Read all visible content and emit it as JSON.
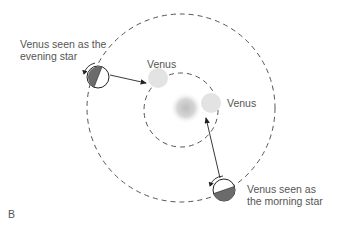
{
  "diagram": {
    "panel_letter": "B",
    "labels": {
      "evening_line1": "Venus seen as the",
      "evening_line2": "evening star",
      "morning_line1": "Venus seen as",
      "morning_line2": "the morning star",
      "venus_top": "Venus",
      "venus_right": "Venus"
    },
    "colors": {
      "orbit": "#555555",
      "venus_fill": "#e3e3e3",
      "sun_center": "#bdbdbd",
      "earth_shade": "#6b6b6b",
      "earth_outline": "#222222",
      "arrow": "#222222",
      "text": "#555555"
    },
    "geometry": {
      "outer_orbit": {
        "cx": 181,
        "cy": 108,
        "r": 94
      },
      "inner_orbit": {
        "cx": 181,
        "cy": 110,
        "r": 37
      },
      "sun": {
        "cx": 186,
        "cy": 108,
        "r": 15
      },
      "venus_top": {
        "cx": 158,
        "cy": 78,
        "r": 10
      },
      "venus_right": {
        "cx": 211,
        "cy": 103,
        "r": 10
      },
      "earth_evening": {
        "cx": 98,
        "cy": 77,
        "r": 11
      },
      "earth_morning": {
        "cx": 224,
        "cy": 190,
        "r": 11
      }
    }
  }
}
